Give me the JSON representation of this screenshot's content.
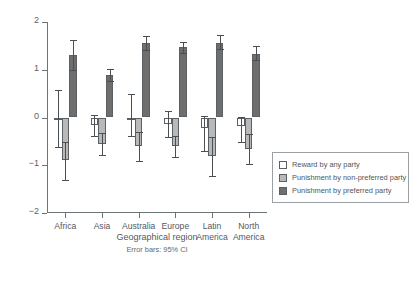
{
  "chart_data": {
    "type": "bar",
    "title": "",
    "xlabel": "Geographical region",
    "ylabel": "Mean judgement of appropriateness",
    "annotation": "Error bars: 95% CI",
    "ylim": [
      -2,
      2
    ],
    "yticks": [
      2,
      1,
      0,
      -1,
      -2
    ],
    "ytick_labels": [
      "2",
      "1",
      "0",
      "−1",
      "−2"
    ],
    "grid": false,
    "legend_position": "right",
    "categories": [
      "Africa",
      "Asia",
      "Australia",
      "Europe",
      "Latin America",
      "North America"
    ],
    "category_lines": [
      [
        "Africa"
      ],
      [
        "Asia"
      ],
      [
        "Australia"
      ],
      [
        "Europe"
      ],
      [
        "Latin",
        "America"
      ],
      [
        "North",
        "America"
      ]
    ],
    "series": [
      {
        "name": "Reward by any party",
        "color": "#ffffff",
        "values": [
          0.0,
          -0.15,
          -0.05,
          -0.13,
          -0.22,
          -0.18
        ],
        "ci_low": [
          -0.62,
          -0.38,
          -0.38,
          -0.4,
          -0.7,
          -0.52
        ],
        "ci_high": [
          0.58,
          0.06,
          0.5,
          0.13,
          0.04,
          0.02
        ]
      },
      {
        "name": "Punishment by non-preferred party",
        "color": "#b9b9b9",
        "values": [
          -0.9,
          -0.55,
          -0.6,
          -0.6,
          -0.8,
          -0.65
        ],
        "ci_low": [
          -1.3,
          -0.78,
          -0.92,
          -0.82,
          -1.22,
          -0.97
        ],
        "ci_high": [
          -0.52,
          -0.32,
          -0.3,
          -0.38,
          -0.4,
          -0.34
        ]
      },
      {
        "name": "Punishment by preferred party",
        "color": "#6e6e6e",
        "values": [
          1.3,
          0.88,
          1.55,
          1.47,
          1.57,
          1.33
        ],
        "ci_low": [
          1.0,
          0.76,
          1.42,
          1.36,
          1.44,
          1.2
        ],
        "ci_high": [
          1.62,
          1.02,
          1.7,
          1.58,
          1.72,
          1.5
        ]
      }
    ]
  },
  "legend": {
    "items": [
      {
        "label": "Reward by any party",
        "swatch": "reward"
      },
      {
        "label": "Punishment by non-preferred party",
        "swatch": "nonpref"
      },
      {
        "label": "Punishment by preferred party",
        "swatch": "pref"
      }
    ]
  },
  "colors": {
    "reward": "#ffffff",
    "nonpref": "#b9b9b9",
    "pref": "#6e6e6e",
    "axis": "#6d7478",
    "text": "#55595d"
  }
}
